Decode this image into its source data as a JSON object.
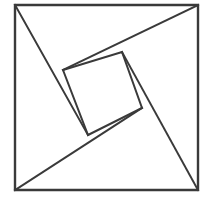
{
  "figure": {
    "name": "tangram-pinwheel-square",
    "title": "Tangram dissection of a square",
    "background_color": "#ffffff",
    "stroke_color": "#3a3a3a",
    "fill_color": "#ffffff",
    "stroke_width": 2,
    "canvas": {
      "width": 212,
      "height": 200
    }
  },
  "chart_data": {
    "type": "diagram",
    "title": "Tangram dissection of a square",
    "outer_square": {
      "name": "outer-square",
      "points": [
        [
          15,
          5
        ],
        [
          198,
          5
        ],
        [
          198,
          190
        ],
        [
          15,
          190
        ]
      ]
    },
    "inner_square": {
      "name": "inner-tilted-square",
      "points": [
        [
          63,
          70
        ],
        [
          122,
          52
        ],
        [
          142,
          108
        ],
        [
          88,
          135
        ]
      ]
    },
    "cut_lines": [
      {
        "name": "cut-top-left-arm",
        "from": [
          15,
          5
        ],
        "to": [
          88,
          135
        ]
      },
      {
        "name": "cut-top-right-arm",
        "from": [
          198,
          5
        ],
        "to": [
          63,
          70
        ]
      },
      {
        "name": "cut-bottom-right-arm",
        "from": [
          198,
          190
        ],
        "to": [
          122,
          52
        ]
      },
      {
        "name": "cut-bottom-left-arm",
        "from": [
          15,
          190
        ],
        "to": [
          142,
          108
        ]
      }
    ],
    "pieces": [
      {
        "name": "piece-top-triangle",
        "points": [
          [
            15,
            5
          ],
          [
            198,
            5
          ],
          [
            122,
            52
          ],
          [
            63,
            70
          ]
        ]
      },
      {
        "name": "piece-right-triangle",
        "points": [
          [
            198,
            5
          ],
          [
            198,
            190
          ],
          [
            142,
            108
          ],
          [
            122,
            52
          ]
        ]
      },
      {
        "name": "piece-bottom-triangle",
        "points": [
          [
            198,
            190
          ],
          [
            15,
            190
          ],
          [
            88,
            135
          ],
          [
            142,
            108
          ]
        ]
      },
      {
        "name": "piece-left-triangle",
        "points": [
          [
            15,
            190
          ],
          [
            15,
            5
          ],
          [
            63,
            70
          ],
          [
            88,
            135
          ]
        ]
      },
      {
        "name": "piece-center-square",
        "points": [
          [
            63,
            70
          ],
          [
            122,
            52
          ],
          [
            142,
            108
          ],
          [
            88,
            135
          ]
        ]
      }
    ]
  }
}
